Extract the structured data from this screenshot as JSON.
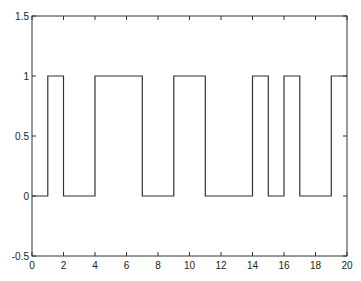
{
  "chart_data": {
    "type": "line",
    "style": "step",
    "title": "",
    "xlabel": "",
    "ylabel": "",
    "xlim": [
      0,
      20
    ],
    "ylim": [
      -0.5,
      1.5
    ],
    "grid": false,
    "legend": null,
    "x_ticks": [
      "0",
      "2",
      "4",
      "6",
      "8",
      "10",
      "12",
      "14",
      "16",
      "18",
      "20"
    ],
    "y_ticks": [
      "-0.5",
      "0",
      "0.5",
      "1",
      "1.5"
    ],
    "series": [
      {
        "name": "signal",
        "color": "#333333",
        "x": [
          0,
          1,
          1,
          2,
          2,
          4,
          4,
          7,
          7,
          9,
          9,
          11,
          11,
          14,
          14,
          15,
          15,
          16,
          16,
          17,
          17,
          19,
          19,
          20
        ],
        "y": [
          0,
          0,
          1,
          1,
          0,
          0,
          1,
          1,
          0,
          0,
          1,
          1,
          0,
          0,
          1,
          1,
          0,
          0,
          1,
          1,
          0,
          0,
          1,
          1
        ]
      }
    ]
  }
}
